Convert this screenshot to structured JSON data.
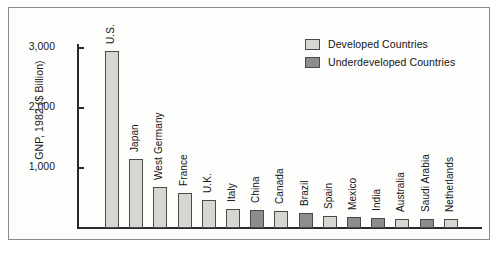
{
  "chart_data": {
    "type": "bar",
    "title": "",
    "xlabel": "",
    "ylabel": "GNP, 1982 ($ Billion)",
    "ylim": [
      0,
      3200
    ],
    "grid": false,
    "legend_position": "top-right",
    "ytick_labels": [
      "3,000",
      "2,000",
      "1,000"
    ],
    "ytick_values": [
      3000,
      2000,
      1000
    ],
    "categories": [
      "U.S.",
      "Japan",
      "West Germany",
      "France",
      "U.K.",
      "Italy",
      "China",
      "Canada",
      "Brazil",
      "Spain",
      "Mexico",
      "India",
      "Australia",
      "Saudi Arabia",
      "Netherlands"
    ],
    "values": [
      2950,
      1150,
      690,
      590,
      465,
      325,
      300,
      290,
      255,
      195,
      185,
      160,
      155,
      150,
      145
    ],
    "groups": [
      "Developed Countries",
      "Developed Countries",
      "Developed Countries",
      "Developed Countries",
      "Developed Countries",
      "Developed Countries",
      "Underdeveloped Countries",
      "Developed Countries",
      "Underdeveloped Countries",
      "Developed Countries",
      "Underdeveloped Countries",
      "Underdeveloped Countries",
      "Developed Countries",
      "Underdeveloped Countries",
      "Developed Countries"
    ],
    "legend": [
      {
        "label": "Developed Countries",
        "color": "#d6d6d2"
      },
      {
        "label": "Underdeveloped Countries",
        "color": "#8d8d8d"
      }
    ],
    "colors": {
      "developed": "#d6d6d2",
      "underdeveloped": "#8d8d8d",
      "bar_outline": "#4a4a4a",
      "axis": "#2a2a2a",
      "frame": "#8b8b8b",
      "background": "#fdfdfc",
      "text": "#141414"
    }
  }
}
